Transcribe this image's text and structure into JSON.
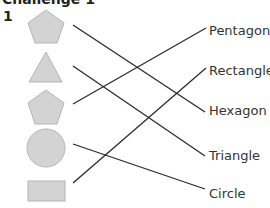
{
  "header": {
    "title": "Challenge 1",
    "question_number": "1"
  },
  "shapes": [
    {
      "name": "pentagon",
      "icon": "pentagon-icon"
    },
    {
      "name": "triangle",
      "icon": "triangle-icon"
    },
    {
      "name": "pentagon",
      "icon": "pentagon-icon"
    },
    {
      "name": "circle",
      "icon": "circle-icon"
    },
    {
      "name": "rectangle",
      "icon": "rectangle-icon"
    }
  ],
  "labels": [
    "Pentagon",
    "Rectangle",
    "Hexagon",
    "Triangle",
    "Circle"
  ],
  "connections": [
    {
      "from_shape": 1,
      "to_label": "Hexagon"
    },
    {
      "from_shape": 2,
      "to_label": "Triangle"
    },
    {
      "from_shape": 3,
      "to_label": "Pentagon"
    },
    {
      "from_shape": 4,
      "to_label": "Circle"
    },
    {
      "from_shape": 5,
      "to_label": "Rectangle"
    }
  ],
  "colors": {
    "shape_fill": "#d3d3d3",
    "shape_stroke": "#b5b5b5",
    "line": "#2a2a2a",
    "text": "#333333"
  }
}
